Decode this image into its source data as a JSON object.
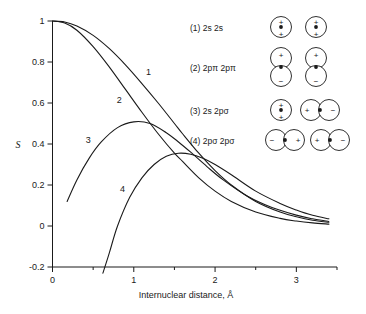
{
  "chart_data": {
    "type": "line",
    "title": "",
    "xlabel": "Internuclear distance, Å",
    "ylabel": "S",
    "xlim": [
      0,
      3.5
    ],
    "ylim": [
      -0.2,
      1.0
    ],
    "grid": false,
    "legend_position": "upper-right-inset",
    "x_ticks": [
      0,
      1,
      2,
      3
    ],
    "x_tick_labels": [
      "0",
      "1",
      "2",
      "3"
    ],
    "x_minor_ticks": [
      0.5,
      1.5,
      2.5,
      3.5
    ],
    "y_ticks": [
      -0.2,
      0,
      0.2,
      0.4,
      0.6,
      0.8,
      1
    ],
    "y_tick_labels": [
      "-0.2",
      "0",
      "0.2",
      "0.4",
      "0.6",
      "0.8",
      "1"
    ],
    "series": [
      {
        "name": "1",
        "label": "(1) 2s 2s",
        "curve_number": "1",
        "x": [
          0,
          0.15,
          0.3,
          0.5,
          0.7,
          0.9,
          1.1,
          1.3,
          1.5,
          1.6,
          1.8,
          2.0,
          2.2,
          2.5,
          2.8,
          3.0,
          3.2,
          3.4
        ],
        "y": [
          1.0,
          0.995,
          0.975,
          0.93,
          0.865,
          0.785,
          0.695,
          0.6,
          0.5,
          0.45,
          0.355,
          0.27,
          0.2,
          0.12,
          0.068,
          0.045,
          0.028,
          0.018
        ]
      },
      {
        "name": "2",
        "label": "(2) 2pπ 2pπ",
        "curve_number": "2",
        "x": [
          0,
          0.15,
          0.3,
          0.5,
          0.7,
          0.9,
          1.1,
          1.3,
          1.5,
          1.6,
          1.8,
          2.0,
          2.2,
          2.5,
          2.8,
          3.0,
          3.2,
          3.4
        ],
        "y": [
          1.0,
          0.99,
          0.955,
          0.875,
          0.775,
          0.665,
          0.555,
          0.45,
          0.355,
          0.315,
          0.235,
          0.17,
          0.12,
          0.068,
          0.037,
          0.024,
          0.015,
          0.009
        ]
      },
      {
        "name": "3",
        "label": "(3) 2s 2pσ",
        "curve_number": "3",
        "x": [
          0.18,
          0.3,
          0.45,
          0.6,
          0.8,
          1.0,
          1.2,
          1.4,
          1.55,
          1.7,
          1.9,
          2.1,
          2.4,
          2.7,
          3.0,
          3.2,
          3.4
        ],
        "y": [
          0.12,
          0.225,
          0.33,
          0.41,
          0.48,
          0.508,
          0.5,
          0.455,
          0.41,
          0.36,
          0.29,
          0.225,
          0.145,
          0.09,
          0.053,
          0.035,
          0.022
        ]
      },
      {
        "name": "4",
        "label": "(4) 2pσ 2pσ",
        "curve_number": "4",
        "x": [
          0.62,
          0.7,
          0.8,
          0.95,
          1.1,
          1.25,
          1.4,
          1.55,
          1.7,
          1.85,
          2.0,
          2.2,
          2.5,
          2.8,
          3.0,
          3.2,
          3.4
        ],
        "y": [
          -0.23,
          -0.13,
          0.0,
          0.14,
          0.235,
          0.3,
          0.34,
          0.355,
          0.35,
          0.33,
          0.3,
          0.25,
          0.17,
          0.11,
          0.078,
          0.052,
          0.035
        ]
      }
    ]
  },
  "curve_labels": [
    {
      "text": "1",
      "x": 1.18,
      "y": 0.735
    },
    {
      "text": "2",
      "x": 0.82,
      "y": 0.6
    },
    {
      "text": "3",
      "x": 0.44,
      "y": 0.405
    },
    {
      "text": "4",
      "x": 0.86,
      "y": 0.165
    }
  ],
  "legend": {
    "entries": [
      {
        "index": "(1)",
        "orbitals": "2s 2s",
        "label": "(1) 2s 2s",
        "diagram": "two-2s-circles"
      },
      {
        "index": "(2)",
        "orbitals": "2pπ 2pπ",
        "label": "(2) 2pπ 2pπ",
        "diagram": "two-stacked-ppi-pairs"
      },
      {
        "index": "(3)",
        "orbitals": "2s 2pσ",
        "label": "(3) 2s 2pσ",
        "diagram": "2s-circle-plus-psigma-pair"
      },
      {
        "index": "(4)",
        "orbitals": "2pσ 2pσ",
        "label": "(4) 2pσ 2pσ",
        "diagram": "two-psigma-pairs"
      }
    ],
    "signs": {
      "plus": "+",
      "minus": "−"
    }
  },
  "colors": {
    "line": "#1a1a1a",
    "background": "#ffffff",
    "text": "#1a1a1a"
  }
}
